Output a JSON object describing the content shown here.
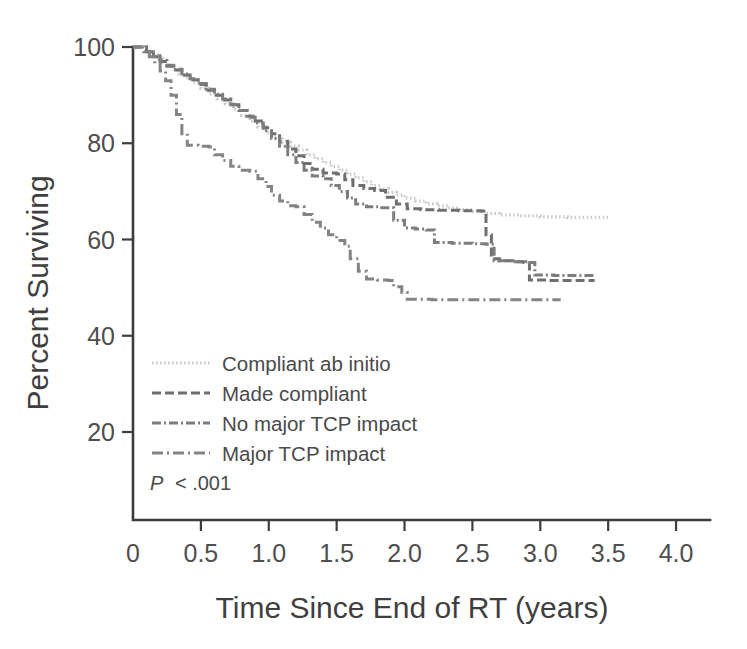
{
  "figure": {
    "background_color": "#ffffff",
    "axis_color": "#3d3d3d",
    "text_color": "#4a4a4a"
  },
  "chart_data": {
    "type": "line",
    "subtype": "kaplan-meier-step",
    "title": "",
    "xlabel": "Time Since End of RT (years)",
    "ylabel": "Percent Surviving",
    "xlim": [
      0,
      4.25
    ],
    "ylim": [
      15,
      103
    ],
    "xticks": [
      0,
      0.5,
      1.0,
      1.5,
      2.0,
      2.5,
      3.0,
      3.5,
      4.0
    ],
    "xtick_labels": [
      "0",
      "0.5",
      "1.0",
      "1.5",
      "2.0",
      "2.5",
      "3.0",
      "3.5",
      "4.0"
    ],
    "yticks": [
      20,
      40,
      60,
      80,
      100
    ],
    "ytick_labels": [
      "20",
      "40",
      "60",
      "80",
      "100"
    ],
    "grid": false,
    "legend_position": "lower-left-inside",
    "annotation": {
      "statistic_symbol": "P",
      "statistic_text": "< .001"
    },
    "series": [
      {
        "name": "Compliant ab initio",
        "color": "#c9c9c9",
        "dash": "1.5 2.5",
        "width": 3.2,
        "final_value": 64.5,
        "points": [
          [
            0.0,
            100.0
          ],
          [
            0.1,
            99.2
          ],
          [
            0.14,
            98.4
          ],
          [
            0.18,
            97.6
          ],
          [
            0.22,
            96.8
          ],
          [
            0.26,
            96.0
          ],
          [
            0.3,
            95.2
          ],
          [
            0.34,
            94.4
          ],
          [
            0.38,
            93.6
          ],
          [
            0.44,
            92.6
          ],
          [
            0.5,
            91.4
          ],
          [
            0.56,
            90.2
          ],
          [
            0.62,
            89.2
          ],
          [
            0.68,
            88.2
          ],
          [
            0.74,
            87.0
          ],
          [
            0.8,
            85.8
          ],
          [
            0.86,
            84.6
          ],
          [
            0.92,
            83.4
          ],
          [
            0.98,
            82.2
          ],
          [
            1.04,
            81.2
          ],
          [
            1.1,
            80.2
          ],
          [
            1.16,
            79.4
          ],
          [
            1.22,
            78.6
          ],
          [
            1.28,
            77.6
          ],
          [
            1.34,
            76.8
          ],
          [
            1.4,
            76.0
          ],
          [
            1.46,
            75.2
          ],
          [
            1.52,
            74.4
          ],
          [
            1.58,
            73.6
          ],
          [
            1.64,
            72.8
          ],
          [
            1.7,
            72.0
          ],
          [
            1.76,
            71.2
          ],
          [
            1.82,
            70.5
          ],
          [
            1.88,
            69.8
          ],
          [
            1.94,
            69.2
          ],
          [
            2.0,
            68.6
          ],
          [
            2.08,
            68.0
          ],
          [
            2.16,
            67.4
          ],
          [
            2.24,
            67.0
          ],
          [
            2.32,
            66.6
          ],
          [
            2.4,
            66.2
          ],
          [
            2.5,
            65.8
          ],
          [
            2.6,
            65.4
          ],
          [
            2.7,
            65.1
          ],
          [
            2.85,
            64.9
          ],
          [
            3.0,
            64.7
          ],
          [
            3.2,
            64.6
          ],
          [
            3.5,
            64.5
          ]
        ]
      },
      {
        "name": "Made compliant",
        "color": "#6f6f6f",
        "dash": "9 4",
        "width": 3.0,
        "final_value": 51.5,
        "points": [
          [
            0.0,
            100.0
          ],
          [
            0.1,
            99.0
          ],
          [
            0.15,
            98.0
          ],
          [
            0.2,
            97.0
          ],
          [
            0.25,
            96.0
          ],
          [
            0.3,
            95.2
          ],
          [
            0.36,
            94.2
          ],
          [
            0.42,
            93.2
          ],
          [
            0.48,
            92.2
          ],
          [
            0.54,
            91.0
          ],
          [
            0.6,
            90.0
          ],
          [
            0.66,
            89.0
          ],
          [
            0.72,
            88.0
          ],
          [
            0.78,
            86.8
          ],
          [
            0.84,
            85.6
          ],
          [
            0.9,
            84.6
          ],
          [
            0.96,
            83.2
          ],
          [
            1.02,
            82.0
          ],
          [
            1.08,
            80.4
          ],
          [
            1.14,
            78.8
          ],
          [
            1.2,
            77.4
          ],
          [
            1.26,
            75.8
          ],
          [
            1.32,
            74.6
          ],
          [
            1.4,
            73.8
          ],
          [
            1.5,
            73.6
          ],
          [
            1.56,
            72.4
          ],
          [
            1.62,
            71.2
          ],
          [
            1.7,
            70.6
          ],
          [
            1.78,
            70.2
          ],
          [
            1.86,
            68.8
          ],
          [
            1.94,
            67.4
          ],
          [
            2.02,
            66.4
          ],
          [
            2.12,
            66.2
          ],
          [
            2.25,
            66.1
          ],
          [
            2.4,
            66.0
          ],
          [
            2.5,
            66.0
          ],
          [
            2.56,
            65.9
          ],
          [
            2.6,
            61.0
          ],
          [
            2.64,
            56.0
          ],
          [
            2.7,
            55.6
          ],
          [
            2.8,
            55.4
          ],
          [
            2.88,
            55.2
          ],
          [
            2.92,
            51.6
          ],
          [
            3.05,
            51.5
          ],
          [
            3.2,
            51.5
          ],
          [
            3.4,
            51.5
          ]
        ]
      },
      {
        "name": "No major TCP impact",
        "color": "#7d7d7d",
        "dash": "9 3 2 3",
        "width": 3.0,
        "final_value": 52.5,
        "points": [
          [
            0.0,
            100.0
          ],
          [
            0.1,
            99.0
          ],
          [
            0.15,
            98.2
          ],
          [
            0.2,
            97.2
          ],
          [
            0.25,
            96.2
          ],
          [
            0.3,
            95.4
          ],
          [
            0.36,
            94.4
          ],
          [
            0.42,
            93.4
          ],
          [
            0.48,
            92.4
          ],
          [
            0.54,
            91.2
          ],
          [
            0.6,
            90.2
          ],
          [
            0.66,
            89.2
          ],
          [
            0.72,
            88.0
          ],
          [
            0.78,
            86.8
          ],
          [
            0.84,
            85.4
          ],
          [
            0.9,
            84.2
          ],
          [
            0.96,
            82.6
          ],
          [
            1.02,
            81.0
          ],
          [
            1.08,
            79.4
          ],
          [
            1.14,
            77.6
          ],
          [
            1.2,
            76.0
          ],
          [
            1.26,
            74.4
          ],
          [
            1.32,
            73.2
          ],
          [
            1.4,
            72.6
          ],
          [
            1.46,
            71.2
          ],
          [
            1.52,
            70.0
          ],
          [
            1.58,
            68.6
          ],
          [
            1.64,
            67.4
          ],
          [
            1.72,
            66.8
          ],
          [
            1.82,
            66.6
          ],
          [
            1.92,
            64.0
          ],
          [
            2.0,
            62.4
          ],
          [
            2.08,
            62.2
          ],
          [
            2.16,
            62.0
          ],
          [
            2.22,
            59.4
          ],
          [
            2.35,
            59.2
          ],
          [
            2.5,
            59.1
          ],
          [
            2.6,
            59.0
          ],
          [
            2.66,
            55.6
          ],
          [
            2.8,
            55.4
          ],
          [
            2.92,
            55.2
          ],
          [
            2.96,
            52.6
          ],
          [
            3.1,
            52.5
          ],
          [
            3.25,
            52.5
          ],
          [
            3.4,
            52.5
          ]
        ]
      },
      {
        "name": "Major TCP impact",
        "color": "#848484",
        "dash": "11 4 2 4",
        "width": 3.0,
        "final_value": 47.5,
        "points": [
          [
            0.0,
            100.0
          ],
          [
            0.08,
            99.0
          ],
          [
            0.12,
            98.0
          ],
          [
            0.16,
            96.6
          ],
          [
            0.2,
            95.0
          ],
          [
            0.24,
            93.0
          ],
          [
            0.28,
            90.0
          ],
          [
            0.32,
            86.0
          ],
          [
            0.36,
            82.0
          ],
          [
            0.4,
            79.6
          ],
          [
            0.48,
            79.4
          ],
          [
            0.56,
            79.2
          ],
          [
            0.6,
            77.6
          ],
          [
            0.66,
            76.4
          ],
          [
            0.72,
            75.2
          ],
          [
            0.78,
            74.4
          ],
          [
            0.86,
            74.2
          ],
          [
            0.92,
            72.6
          ],
          [
            0.98,
            71.0
          ],
          [
            1.02,
            69.2
          ],
          [
            1.08,
            68.0
          ],
          [
            1.14,
            67.0
          ],
          [
            1.2,
            66.8
          ],
          [
            1.26,
            65.2
          ],
          [
            1.32,
            63.6
          ],
          [
            1.38,
            62.4
          ],
          [
            1.44,
            61.0
          ],
          [
            1.5,
            59.8
          ],
          [
            1.56,
            58.6
          ],
          [
            1.6,
            56.0
          ],
          [
            1.66,
            53.4
          ],
          [
            1.72,
            51.8
          ],
          [
            1.8,
            51.6
          ],
          [
            1.88,
            51.5
          ],
          [
            1.92,
            50.2
          ],
          [
            1.98,
            49.0
          ],
          [
            2.02,
            47.6
          ],
          [
            2.2,
            47.5
          ],
          [
            2.5,
            47.5
          ],
          [
            2.8,
            47.5
          ],
          [
            3.0,
            47.5
          ],
          [
            3.15,
            47.5
          ]
        ]
      }
    ]
  },
  "legend": {
    "entries": [
      {
        "label": "Compliant ab initio"
      },
      {
        "label": "Made compliant"
      },
      {
        "label": "No major TCP impact"
      },
      {
        "label": "Major TCP impact"
      }
    ]
  }
}
